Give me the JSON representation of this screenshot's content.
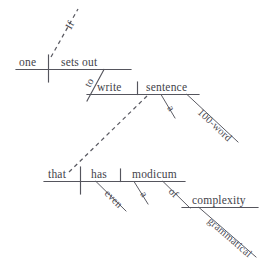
{
  "diagram": {
    "type": "reed-kellogg-sentence-diagram",
    "sentence": "If one sets out to write a 100-word sentence that has even a modicum of grammatical complexity",
    "ink_color": "#55555d",
    "background_color": "#ffffff",
    "clauses": {
      "main": {
        "subject": "one",
        "verb": "sets out",
        "subject_label": "one",
        "verb_label": "sets out"
      },
      "infinitive": {
        "marker": "to",
        "verb": "write",
        "object": "sentence",
        "object_article": "a",
        "object_modifier": "100-word"
      },
      "relative": {
        "subject": "that",
        "verb": "has",
        "adverb": "even",
        "object": "modicum",
        "object_article": "a",
        "preposition": "of",
        "prep_object": "complexity",
        "prep_object_modifier": "grammatical"
      },
      "subordinator": {
        "word": "If",
        "connector": "dashed-line"
      }
    },
    "words": {
      "if": "If",
      "one": "one",
      "sets_out": "sets out",
      "to": "to",
      "write": "write",
      "sentence": "sentence",
      "a_sentence": "a",
      "hundred_word": "100-word",
      "that": "that",
      "has": "has",
      "even": "even",
      "modicum": "modicum",
      "a_modicum": "a",
      "of": "of",
      "complexity": "complexity",
      "grammatical": "grammatical"
    }
  }
}
